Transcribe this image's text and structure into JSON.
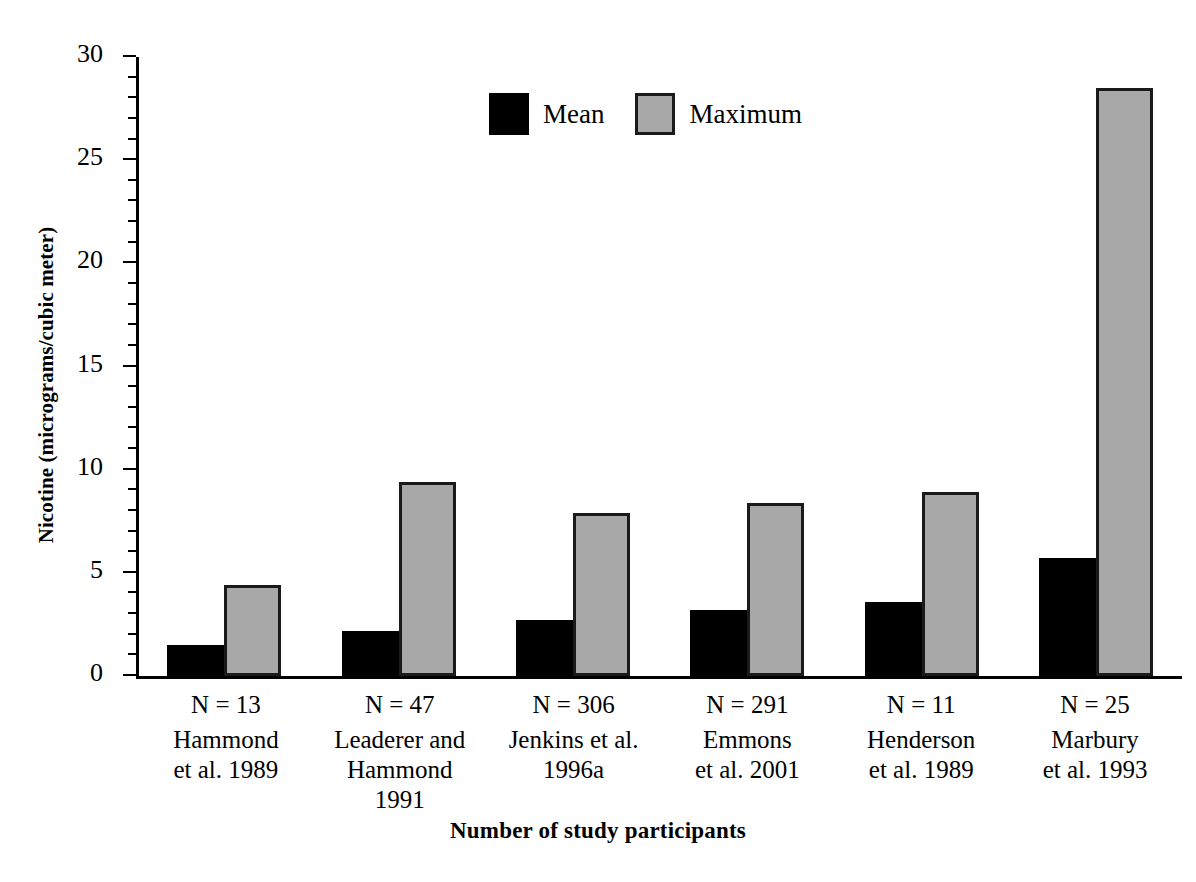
{
  "chart_data": {
    "type": "bar",
    "title": "",
    "xlabel": "Number of study participants",
    "ylabel": "Nicotine (micrograms/cubic meter)",
    "ylim": [
      0,
      30
    ],
    "ytick_labels": [
      "0",
      "5",
      "10",
      "15",
      "20",
      "25",
      "30"
    ],
    "ytick_values": [
      0,
      5,
      10,
      15,
      20,
      25,
      30
    ],
    "ytick_minor_step": 1,
    "grid": false,
    "legend_position": "top-center",
    "categories": [
      "N = 13\nHammond et al. 1989",
      "N = 47\nLeaderer and Hammond 1991",
      "N = 306\nJenkins et al. 1996a",
      "N = 291\nEmmons et al. 2001",
      "N = 11\nHenderson et al. 1989",
      "N = 25\nMarbury et al. 1993"
    ],
    "series": [
      {
        "name": "Mean",
        "values": [
          1.5,
          2.2,
          2.7,
          3.2,
          3.6,
          5.7
        ]
      },
      {
        "name": "Maximum",
        "values": [
          4.4,
          9.4,
          7.9,
          8.4,
          8.9,
          28.5
        ]
      }
    ],
    "colors": {
      "mean": "#000000",
      "maximum": "#a8a8a8",
      "maximum_border": "#1a1a1a",
      "axis": "#000000",
      "background": "#ffffff"
    }
  },
  "legend": {
    "items": [
      {
        "label": "Mean",
        "swatch": "mean"
      },
      {
        "label": "Maximum",
        "swatch": "maximum"
      }
    ]
  },
  "x_categories": [
    {
      "n_label": "N = 13",
      "cite": [
        "Hammond",
        "et al. 1989"
      ]
    },
    {
      "n_label": "N = 47",
      "cite": [
        "Leaderer and",
        "Hammond",
        "1991"
      ]
    },
    {
      "n_label": "N = 306",
      "cite": [
        "Jenkins et al.",
        "1996a"
      ]
    },
    {
      "n_label": "N = 291",
      "cite": [
        "Emmons",
        "et al. 2001"
      ]
    },
    {
      "n_label": "N = 11",
      "cite": [
        "Henderson",
        "et al. 1989"
      ]
    },
    {
      "n_label": "N = 25",
      "cite": [
        "Marbury",
        "et al. 1993"
      ]
    }
  ],
  "axes": {
    "y_title": "Nicotine (micrograms/cubic meter)",
    "x_title": "Number of study participants",
    "y_ticks": [
      "0",
      "5",
      "10",
      "15",
      "20",
      "25",
      "30"
    ]
  }
}
